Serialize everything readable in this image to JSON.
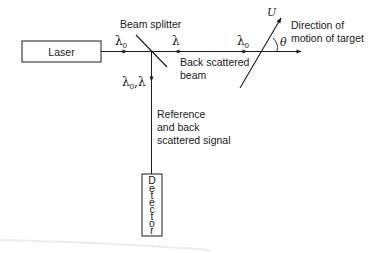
{
  "diagram": {
    "laser": {
      "label": "Laser"
    },
    "beam_splitter": {
      "label": "Beam splitter"
    },
    "detector": {
      "label": "Detector",
      "letters": [
        "D",
        "e",
        "t",
        "e",
        "c",
        "t",
        "o",
        "r"
      ]
    },
    "incident_beam": {
      "symbol": "λ",
      "subscript": "0"
    },
    "back_beam": {
      "symbol": "λ"
    },
    "target_beam": {
      "symbol": "λ",
      "subscript": "0"
    },
    "down_beam": {
      "symbol1": "λ",
      "subscript": "0",
      "sep": ",",
      "symbol2": "λ"
    },
    "back_scattered_beam": {
      "line1": "Back scattered",
      "line2": "beam"
    },
    "reference_signal": {
      "line1": "Reference",
      "line2": "and back",
      "line3": "scattered signal"
    },
    "target": {
      "velocity": "U",
      "angle": "θ"
    },
    "direction_label": {
      "line1": "Direction of",
      "line2": "motion of target"
    }
  },
  "colors": {
    "ink": "#1a1a1a",
    "background": "#ffffff",
    "artifact": "#e6e6e6"
  }
}
